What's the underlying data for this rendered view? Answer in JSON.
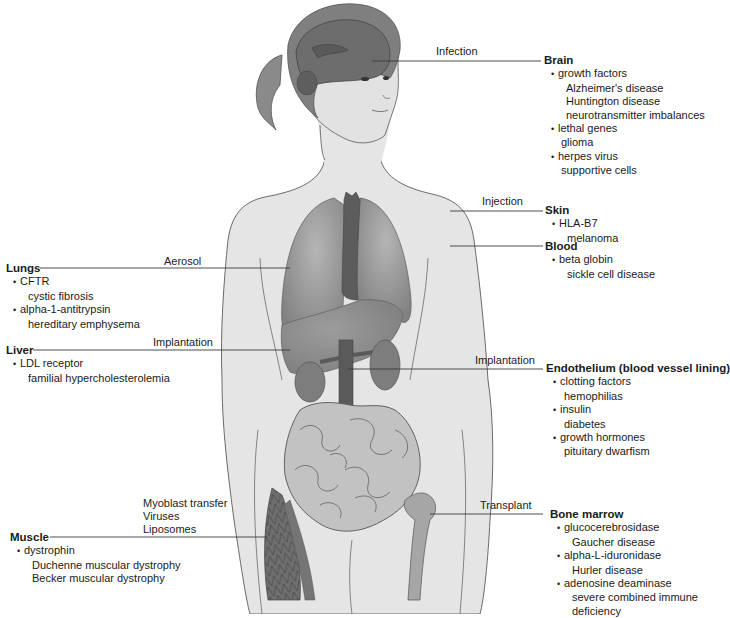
{
  "figure": {
    "colors": {
      "skin": "#e4e4e4",
      "outline": "#6a6a6a",
      "hair": "#7d7d7d",
      "brain": "#6f6f6f",
      "lungs": "#8e8e8e",
      "heart": "#5c5c5c",
      "liver": "#8a8a8a",
      "kidney": "#7a7a7a",
      "intestine": "#bdbdbd",
      "muscle": "#6b6b6b",
      "bone": "#a8a8a8",
      "leader": "#3a3a3a"
    }
  },
  "routes": {
    "infection": "Infection",
    "injection": "Injection",
    "aerosol": "Aerosol",
    "implantation_liver": "Implantation",
    "implantation_endothelium": "Implantation",
    "transplant": "Transplant",
    "muscle": [
      "Myoblast transfer",
      "Viruses",
      "Liposomes"
    ]
  },
  "targets": {
    "brain": {
      "organ": "Brain",
      "genes": [
        {
          "gene": "growth factors",
          "diseases": [
            "Alzheimer's disease",
            "Huntington disease",
            "neurotransmitter imbalances"
          ]
        },
        {
          "gene": "lethal genes",
          "diseases": [
            "glioma"
          ]
        },
        {
          "gene": "herpes virus",
          "diseases": [
            "supportive cells"
          ]
        }
      ]
    },
    "skin": {
      "organ": "Skin",
      "genes": [
        {
          "gene": "HLA-B7",
          "diseases": [
            "melanoma"
          ]
        }
      ]
    },
    "blood": {
      "organ": "Blood",
      "genes": [
        {
          "gene": "beta globin",
          "diseases": [
            "sickle cell disease"
          ]
        }
      ]
    },
    "lungs": {
      "organ": "Lungs",
      "genes": [
        {
          "gene": "CFTR",
          "diseases": [
            "cystic fibrosis"
          ]
        },
        {
          "gene": "alpha-1-antitrypsin",
          "diseases": [
            "hereditary emphysema"
          ]
        }
      ]
    },
    "liver": {
      "organ": "Liver",
      "genes": [
        {
          "gene": "LDL receptor",
          "diseases": [
            "familial hypercholesterolemia"
          ]
        }
      ]
    },
    "endothelium": {
      "organ": "Endothelium (blood vessel lining)",
      "genes": [
        {
          "gene": "clotting factors",
          "diseases": [
            "hemophilias"
          ]
        },
        {
          "gene": "insulin",
          "diseases": [
            "diabetes"
          ]
        },
        {
          "gene": "growth hormones",
          "diseases": [
            "pituitary dwarfism"
          ]
        }
      ]
    },
    "bone_marrow": {
      "organ": "Bone marrow",
      "genes": [
        {
          "gene": "glucocerebrosidase",
          "diseases": [
            "Gaucher disease"
          ]
        },
        {
          "gene": "alpha-L-iduronidase",
          "diseases": [
            "Hurler disease"
          ]
        },
        {
          "gene": "adenosine deaminase",
          "diseases": [
            "severe combined immune",
            "deficiency"
          ]
        }
      ]
    },
    "muscle": {
      "organ": "Muscle",
      "genes": [
        {
          "gene": "dystrophin",
          "diseases": [
            "Duchenne muscular dystrophy",
            "Becker muscular dystrophy"
          ]
        }
      ]
    }
  }
}
